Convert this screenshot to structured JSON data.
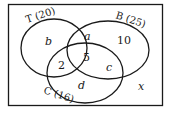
{
  "diagram": {
    "type": "venn-3-set",
    "colors": {
      "stroke": "#1a1a1a",
      "background": "#ffffff"
    },
    "sets": {
      "T": {
        "label": "T (20)",
        "name": "T",
        "total": 20
      },
      "B": {
        "label": "B (25)",
        "name": "B",
        "total": 25
      },
      "C": {
        "label": "C (16)",
        "name": "C",
        "total": 16
      }
    },
    "regions": {
      "t_only": "b",
      "t_and_b_only": "a",
      "b_only": "10",
      "t_and_c_only": "2",
      "t_b_c": "5",
      "b_and_c_only": "c",
      "c_only": "d",
      "outside": "x"
    }
  }
}
